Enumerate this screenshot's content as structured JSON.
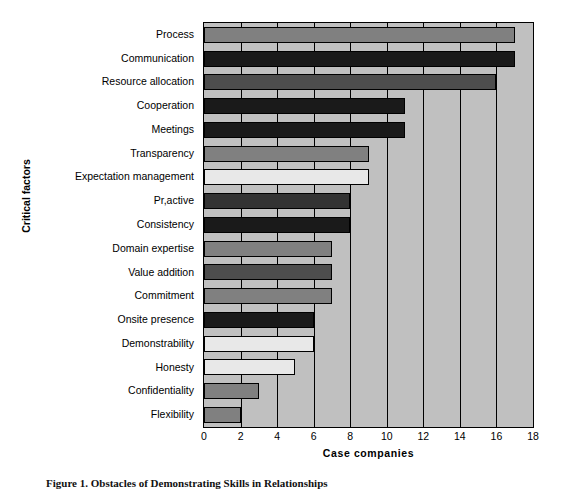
{
  "chart_data": {
    "type": "bar",
    "orientation": "horizontal",
    "title": "",
    "xlabel": "Case companies",
    "ylabel": "Critical factors",
    "xlim": [
      0,
      18
    ],
    "xticks": [
      0,
      2,
      4,
      6,
      8,
      10,
      12,
      14,
      16,
      18
    ],
    "grid": true,
    "legend": false,
    "plot_background": "#c0c0c0",
    "categories": [
      "Process",
      "Communication",
      "Resource allocation",
      "Cooperation",
      "Meetings",
      "Transparency",
      "Expectation management",
      "Pr, active",
      "Consistency",
      "Domain expertise",
      "Value addition",
      "Commitment",
      "Onsite presence",
      "Demonstrability",
      "Honesty",
      "Confidentiality",
      "Flexibility"
    ],
    "values": [
      17,
      17,
      16,
      11,
      11,
      9,
      9,
      8,
      8,
      7,
      7,
      7,
      6,
      6,
      5,
      3,
      2
    ],
    "bar_colors": [
      "#808080",
      "#1a1a1a",
      "#4d4d4d",
      "#1a1a1a",
      "#1a1a1a",
      "#808080",
      "#e8e8e8",
      "#333333",
      "#1a1a1a",
      "#808080",
      "#4d4d4d",
      "#808080",
      "#1a1a1a",
      "#e8e8e8",
      "#e8e8e8",
      "#808080",
      "#808080"
    ]
  },
  "ylabels": [
    "Process",
    "Communication",
    "Resource allocation",
    "Cooperation",
    "Meetings",
    "Transparency",
    "Expectation management",
    "Pr,active",
    "Consistency",
    "Domain expertise",
    "Value addition",
    "Commitment",
    "Onsite presence",
    "Demonstrability",
    "Honesty",
    "Confidentiality",
    "Flexibility"
  ],
  "xticklabels": [
    "0",
    "2",
    "4",
    "6",
    "8",
    "10",
    "12",
    "14",
    "16",
    "18"
  ],
  "axis_titles": {
    "x": "Case companies",
    "y": "Critical factors"
  },
  "caption": "Figure 1. Obstacles of Demonstrating Skills in Relationships"
}
